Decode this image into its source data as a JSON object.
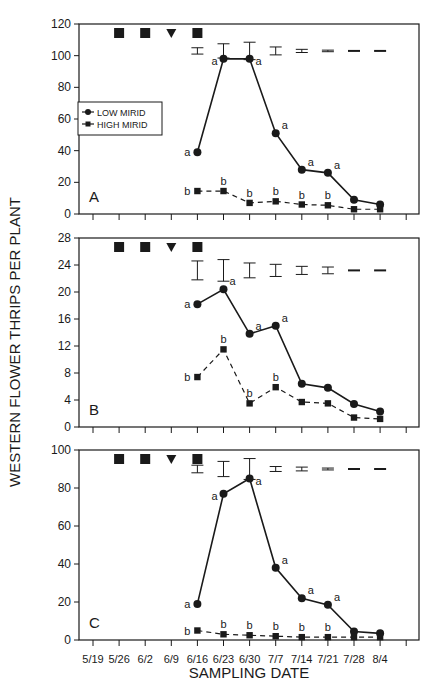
{
  "figure": {
    "ylabel": "WESTERN FLOWER THRIPS PER PLANT",
    "xlabel": "SAMPLING DATE",
    "legend": [
      {
        "label": "LOW MIRID",
        "marker": "circle",
        "line": "solid"
      },
      {
        "label": "HIGH MIRID",
        "marker": "square",
        "line": "dashed"
      }
    ],
    "treatment_markers": [
      {
        "date": "5/26",
        "symbol": "square"
      },
      {
        "date": "6/2",
        "symbol": "square"
      },
      {
        "date": "6/9",
        "symbol": "triangle-down"
      },
      {
        "date": "6/16",
        "symbol": "square"
      }
    ],
    "colors": {
      "ink": "#1a1a1a",
      "background": "#ffffff"
    }
  },
  "chart_data": [
    {
      "type": "line",
      "panel": "A",
      "title": "",
      "xlabel": "SAMPLING DATE",
      "ylabel": "WESTERN FLOWER THRIPS PER PLANT",
      "categories": [
        "5/19",
        "5/26",
        "6/2",
        "6/9",
        "6/16",
        "6/23",
        "6/30",
        "7/7",
        "7/14",
        "7/21",
        "7/28",
        "8/4"
      ],
      "x": [
        "6/16",
        "6/23",
        "6/30",
        "7/7",
        "7/14",
        "7/21",
        "7/28",
        "8/4"
      ],
      "ylim": [
        0,
        120
      ],
      "yticks": [
        0,
        20,
        40,
        60,
        80,
        100,
        120
      ],
      "legend_position": "upper left",
      "grid": false,
      "series": [
        {
          "name": "LOW MIRID",
          "values": [
            39,
            98,
            98,
            51,
            28,
            26,
            9,
            6
          ],
          "letters": [
            "a",
            "a",
            "a",
            "a",
            "a",
            "a",
            "",
            ""
          ]
        },
        {
          "name": "HIGH MIRID",
          "values": [
            14.5,
            14.5,
            7,
            8,
            6,
            5.5,
            3,
            3
          ],
          "letters": [
            "b",
            "b",
            "b",
            "b",
            "b",
            "b",
            "",
            ""
          ]
        }
      ],
      "error_bars": {
        "y_center": 103,
        "half_widths": [
          2,
          4.5,
          5.5,
          2.5,
          1,
          0.5,
          0.3,
          0.3
        ]
      }
    },
    {
      "type": "line",
      "panel": "B",
      "title": "",
      "xlabel": "SAMPLING DATE",
      "ylabel": "WESTERN FLOWER THRIPS PER PLANT",
      "categories": [
        "5/19",
        "5/26",
        "6/2",
        "6/9",
        "6/16",
        "6/23",
        "6/30",
        "7/7",
        "7/14",
        "7/21",
        "7/28",
        "8/4"
      ],
      "x": [
        "6/16",
        "6/23",
        "6/30",
        "7/7",
        "7/14",
        "7/21",
        "7/28",
        "8/4"
      ],
      "ylim": [
        0,
        28
      ],
      "yticks": [
        0,
        4,
        8,
        12,
        16,
        20,
        24,
        28
      ],
      "grid": false,
      "series": [
        {
          "name": "LOW MIRID",
          "values": [
            18.2,
            20.4,
            13.8,
            15,
            6.4,
            5.8,
            3.4,
            2.3
          ],
          "letters": [
            "a",
            "a",
            "a",
            "a",
            "",
            "",
            "",
            ""
          ]
        },
        {
          "name": "HIGH MIRID",
          "values": [
            7.4,
            11.5,
            3.5,
            5.9,
            3.7,
            3.5,
            1.4,
            1.2
          ],
          "letters": [
            "b",
            "b",
            "b",
            "b",
            "",
            "",
            "",
            ""
          ]
        }
      ],
      "error_bars": {
        "y_center": 23.2,
        "half_widths": [
          1.4,
          1.6,
          1.1,
          0.9,
          0.6,
          0.5,
          0.1,
          0.1
        ]
      }
    },
    {
      "type": "line",
      "panel": "C",
      "title": "",
      "xlabel": "SAMPLING DATE",
      "ylabel": "WESTERN FLOWER THRIPS PER PLANT",
      "categories": [
        "5/19",
        "5/26",
        "6/2",
        "6/9",
        "6/16",
        "6/23",
        "6/30",
        "7/7",
        "7/14",
        "7/21",
        "7/28",
        "8/4"
      ],
      "x": [
        "6/16",
        "6/23",
        "6/30",
        "7/7",
        "7/14",
        "7/21",
        "7/28",
        "8/4"
      ],
      "ylim": [
        0,
        100
      ],
      "yticks": [
        0,
        20,
        40,
        60,
        80,
        100
      ],
      "grid": false,
      "series": [
        {
          "name": "LOW MIRID",
          "values": [
            19,
            77,
            85,
            38,
            22,
            18.5,
            4.5,
            3.5
          ],
          "letters": [
            "a",
            "a",
            "a",
            "a",
            "a",
            "a",
            "",
            ""
          ]
        },
        {
          "name": "HIGH MIRID",
          "values": [
            5,
            3,
            2.5,
            2,
            1.5,
            1.5,
            1.5,
            1.5
          ],
          "letters": [
            "b",
            "b",
            "b",
            "b",
            "b",
            "b",
            "",
            ""
          ]
        }
      ],
      "error_bars": {
        "y_center": 90,
        "half_widths": [
          2,
          4,
          5.5,
          1.3,
          1,
          0.5,
          0.3,
          0.3
        ]
      }
    }
  ]
}
